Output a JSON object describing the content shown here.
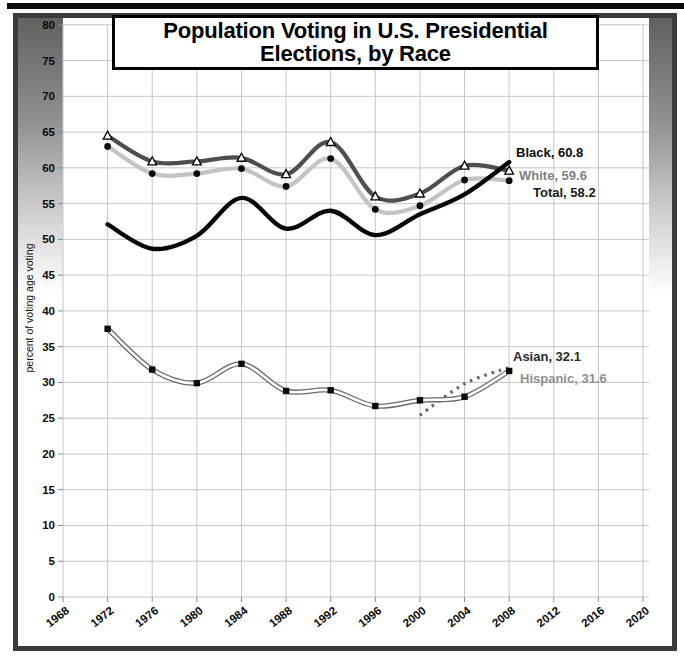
{
  "page": {
    "top_bar_color": "#0a0a0a",
    "frame_border_color": "#3b3b3b"
  },
  "title": {
    "line1": "Population Voting in U.S. Presidential",
    "line2": "Elections, by Race"
  },
  "chart_data": {
    "type": "line",
    "title": "Population Voting in U.S. Presidential Elections, by Race",
    "xlabel": "",
    "ylabel": "percent of voting age voting",
    "ylim": [
      0,
      80
    ],
    "y_tick_step": 5,
    "y_ticks": [
      0,
      5,
      10,
      15,
      20,
      25,
      30,
      35,
      40,
      45,
      50,
      55,
      60,
      65,
      70,
      75,
      80
    ],
    "x_ticks": [
      1968,
      1972,
      1976,
      1980,
      1984,
      1988,
      1992,
      1996,
      2000,
      2004,
      2008,
      2012,
      2016,
      2020
    ],
    "grid": true,
    "grid_color": "#c6c6c6",
    "tick_color": "#8a8a8a",
    "axis_text_color": "#0a0a0a",
    "legend_position": "end-of-line-labels",
    "series": [
      {
        "name": "White",
        "end_label": "White, 59.6",
        "label_color": "#7f7f7f",
        "color": "#4e4e4e",
        "line_style": "solid",
        "marker": "triangle",
        "years": [
          1972,
          1976,
          1980,
          1984,
          1988,
          1992,
          1996,
          2000,
          2004,
          2008
        ],
        "values": [
          64.5,
          60.9,
          60.9,
          61.4,
          59.1,
          63.6,
          56.0,
          56.4,
          60.3,
          59.6
        ],
        "label_pos": [
          519,
          180
        ]
      },
      {
        "name": "Total",
        "end_label": "Total, 58.2",
        "label_color": "#1a1a1a",
        "color": "#c3c3c3",
        "line_style": "solid",
        "marker": "circle",
        "years": [
          1972,
          1976,
          1980,
          1984,
          1988,
          1992,
          1996,
          2000,
          2004,
          2008
        ],
        "values": [
          63.0,
          59.2,
          59.2,
          59.9,
          57.4,
          61.3,
          54.2,
          54.7,
          58.3,
          58.2
        ],
        "label_pos": [
          533,
          197
        ]
      },
      {
        "name": "Black",
        "end_label": "Black, 60.8",
        "label_color": "#0a0a0a",
        "color": "#060606",
        "line_style": "solid",
        "marker": "none",
        "years": [
          1972,
          1976,
          1980,
          1984,
          1988,
          1992,
          1996,
          2000,
          2004,
          2008
        ],
        "values": [
          52.1,
          48.7,
          50.5,
          55.8,
          51.5,
          54.0,
          50.6,
          53.5,
          56.3,
          60.8
        ],
        "label_pos": [
          516,
          157
        ]
      },
      {
        "name": "Asian",
        "end_label": "Asian, 32.1",
        "label_color": "#2b2b2b",
        "color": "#666666",
        "line_style": "dotted",
        "marker": "none",
        "years": [
          2000,
          2004,
          2008
        ],
        "values": [
          25.4,
          29.8,
          32.1
        ],
        "label_pos": [
          513,
          361
        ]
      },
      {
        "name": "Hispanic",
        "end_label": "Hispanic, 31.6",
        "label_color": "#8f8f8f",
        "color": "#6b6b6b",
        "line_style": "outlined-white",
        "marker": "square",
        "years": [
          1972,
          1976,
          1980,
          1984,
          1988,
          1992,
          1996,
          2000,
          2004,
          2008
        ],
        "values": [
          37.5,
          31.8,
          29.9,
          32.6,
          28.8,
          28.9,
          26.7,
          27.5,
          28.0,
          31.6
        ],
        "label_pos": [
          520,
          383
        ]
      }
    ]
  }
}
